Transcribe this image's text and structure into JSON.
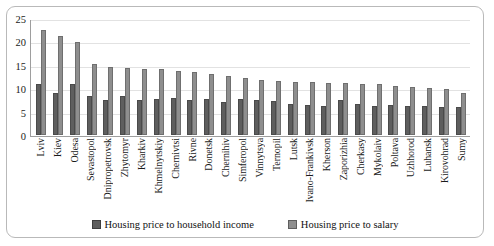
{
  "chart_data": {
    "type": "bar",
    "title": "",
    "xlabel": "",
    "ylabel": "",
    "ylim": [
      0,
      25
    ],
    "yticks": [
      0,
      5,
      10,
      15,
      20,
      25
    ],
    "grid": true,
    "legend_position": "bottom",
    "categories": [
      "Lviv",
      "Kiev",
      "Odesa",
      "Sevastopol",
      "Dnipropetrovsk",
      "Zhytomyr",
      "Kharkiv",
      "Khmelnytskiy",
      "Chernivtsi",
      "Rivne",
      "Donetsk",
      "Chernihiv",
      "Simferopol",
      "Vinnytsya",
      "Ternopil",
      "Lutsk",
      "Ivano-Frankivsk",
      "Kherson",
      "Zaporizhia",
      "Cherkasy",
      "Mykolaiv",
      "Poltava",
      "Uzhhorod",
      "Luhansk",
      "Kirovohrad",
      "Sumy"
    ],
    "series": [
      {
        "name": "Housing price to household income",
        "color": "#5e5e5e",
        "values": [
          11.0,
          8.9,
          11.0,
          8.4,
          7.5,
          8.4,
          7.4,
          7.8,
          8.0,
          7.5,
          7.8,
          7.1,
          7.6,
          7.4,
          7.2,
          6.7,
          6.4,
          6.2,
          7.5,
          6.6,
          6.3,
          6.4,
          6.1,
          6.2,
          5.9,
          6.0
        ]
      },
      {
        "name": "Housing price to salary",
        "color": "#8e8e8e",
        "values": [
          22.4,
          21.1,
          19.8,
          15.1,
          14.6,
          14.3,
          14.2,
          14.0,
          13.6,
          13.4,
          13.1,
          12.6,
          12.2,
          11.8,
          11.6,
          11.4,
          11.3,
          11.2,
          11.1,
          10.9,
          10.8,
          10.5,
          10.3,
          10.1,
          9.8,
          8.9
        ]
      }
    ]
  },
  "legend": {
    "items": [
      {
        "label": "Housing price to household income"
      },
      {
        "label": "Housing price to salary"
      }
    ]
  }
}
